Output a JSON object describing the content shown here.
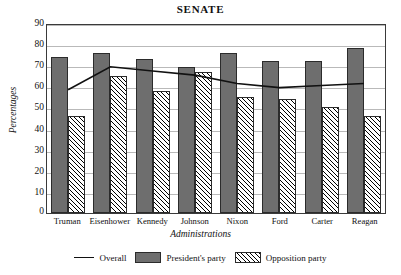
{
  "chart_data": {
    "type": "bar",
    "title": "SENATE",
    "xlabel": "Administrations",
    "ylabel": "Percentages",
    "ylim": [
      0,
      90
    ],
    "yticks": [
      0,
      10,
      20,
      30,
      40,
      50,
      60,
      70,
      80,
      90
    ],
    "grid": true,
    "legend_position": "bottom",
    "categories": [
      "Truman",
      "Eisenhower",
      "Kennedy",
      "Johnson",
      "Nixon",
      "Ford",
      "Carter",
      "Reagan"
    ],
    "series": [
      {
        "name": "President's party",
        "type": "bar",
        "values": [
          74,
          76,
          73,
          69,
          76,
          72,
          72,
          78
        ]
      },
      {
        "name": "Opposition party",
        "type": "bar",
        "values": [
          46,
          65,
          58,
          67,
          55,
          54,
          50,
          46
        ]
      },
      {
        "name": "Overall",
        "type": "line",
        "values": [
          59,
          70,
          68,
          66,
          62,
          60,
          61,
          62
        ]
      }
    ]
  },
  "legend": {
    "overall_label": "Overall",
    "president_label": "President's party",
    "opposition_label": "Opposition party"
  },
  "colors": {
    "president_fill": "#6e6e6e",
    "opposition_fill": "#ffffff",
    "line": "#111111",
    "grid": "#b9b9b9",
    "frame": "#3a3a3a"
  }
}
